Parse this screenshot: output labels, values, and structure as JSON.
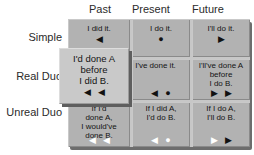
{
  "columns": [
    "Past",
    "Present",
    "Future"
  ],
  "row_labels": [
    "Simple",
    "Real Duo",
    "Unreal Duo"
  ],
  "cells": {
    "simple_past": {
      "lines": [
        "I did it."
      ],
      "markers": [
        {
          "name": "triangle-left",
          "glyph": "◀",
          "color": "#111111"
        }
      ]
    },
    "simple_present": {
      "lines": [
        "I do it."
      ],
      "markers": [
        {
          "name": "circle",
          "glyph": "●",
          "color": "#111111"
        }
      ]
    },
    "simple_future": {
      "lines": [
        "I'll do it."
      ],
      "markers": [
        {
          "name": "triangle-right",
          "glyph": "▶",
          "color": "#111111"
        }
      ]
    },
    "realduo_past": {
      "lines": [],
      "markers": []
    },
    "realduo_present": {
      "lines": [
        "I've done it."
      ],
      "markers": [
        {
          "name": "triangle-left",
          "glyph": "◀",
          "color": "#111111"
        },
        {
          "name": "circle",
          "glyph": "●",
          "color": "#111111"
        }
      ]
    },
    "realduo_future": {
      "lines": [
        "I'll've done A",
        "before",
        "I do B."
      ],
      "markers": [
        {
          "name": "triangle-right",
          "glyph": "▶",
          "color": "#111111"
        },
        {
          "name": "triangle-right",
          "glyph": "▶",
          "color": "#111111"
        }
      ]
    },
    "unrealduo_past": {
      "lines": [
        "If I'd",
        "done A,",
        "I would've",
        "done B."
      ],
      "markers": [
        {
          "name": "triangle-left",
          "glyph": "◀",
          "color": "#ffffff"
        },
        {
          "name": "triangle-left",
          "glyph": "◀",
          "color": "#ffffff"
        }
      ]
    },
    "unrealduo_present": {
      "lines": [
        "If I did A,",
        "I'd do B."
      ],
      "markers": [
        {
          "name": "triangle-left",
          "glyph": "◀",
          "color": "#ffffff"
        },
        {
          "name": "circle",
          "glyph": "●",
          "color": "#ffffff"
        }
      ]
    },
    "unrealduo_future": {
      "lines": [
        "If I do A,",
        "I'll do B."
      ],
      "markers": [
        {
          "name": "triangle-right",
          "glyph": "▶",
          "color": "#ffffff"
        },
        {
          "name": "triangle-right",
          "glyph": "▶",
          "color": "#111111"
        }
      ]
    }
  },
  "popup": {
    "lines": [
      "I'd done A",
      "before",
      "I did B."
    ],
    "markers": [
      {
        "name": "triangle-left",
        "glyph": "◀",
        "color": "#111111"
      },
      {
        "name": "triangle-left",
        "glyph": "◀",
        "color": "#111111"
      }
    ]
  },
  "colors": {
    "background": "#ffffff",
    "cell_bg": "#b2b2b2",
    "cell_gap": "#c7c7c7",
    "popup_bg": "#c9c9c9",
    "shadow": "#5e5e5e",
    "marker_black": "#111111",
    "marker_white": "#ffffff",
    "text": "#141414"
  }
}
